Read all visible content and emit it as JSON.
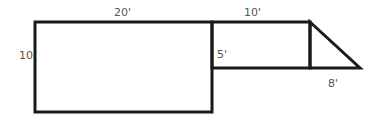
{
  "diagram": {
    "stroke_color": "#1a1a1a",
    "label_color": "#555555",
    "shapes": {
      "large_rectangle": {
        "x": 35,
        "y": 22,
        "width": 177,
        "height": 90
      },
      "small_rectangle": {
        "x": 212,
        "y": 22,
        "width": 98,
        "height": 46
      },
      "triangle": {
        "points": "310,22 360,68 310,68"
      }
    },
    "labels": {
      "large_width": "20'",
      "large_height": "10",
      "small_width": "10'",
      "small_height": "5'",
      "triangle_base": "8'"
    }
  }
}
